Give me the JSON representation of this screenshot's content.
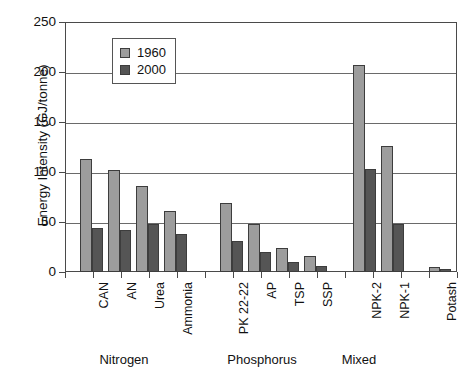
{
  "chart_data": {
    "type": "bar",
    "title": "",
    "xlabel": "",
    "ylabel": "Energy Intensity (GJ/tonne)",
    "ylim": [
      0,
      250
    ],
    "yticks": [
      0,
      50,
      100,
      150,
      200,
      250
    ],
    "grid": true,
    "legend_position": "upper-left-inside",
    "categories": [
      "CAN",
      "AN",
      "Urea",
      "Ammonia",
      "PK 22-22",
      "AP",
      "TSP",
      "SSP",
      "NPK-2",
      "NPK-1",
      "Potash"
    ],
    "series": [
      {
        "name": "1960",
        "color": "#9d9d9d",
        "values": [
          113,
          102,
          86,
          61,
          69,
          48,
          24,
          16,
          207,
          126,
          5
        ]
      },
      {
        "name": "2000",
        "color": "#555555",
        "values": [
          44,
          42,
          48,
          38,
          31,
          20,
          10,
          6,
          103,
          48,
          3
        ]
      }
    ],
    "groups": [
      {
        "label": "Nitrogen",
        "categories": [
          "CAN",
          "AN",
          "Urea",
          "Ammonia"
        ]
      },
      {
        "label": "Phosphorus",
        "categories": [
          "PK 22-22",
          "AP",
          "TSP",
          "SSP"
        ]
      },
      {
        "label": "Mixed",
        "categories": [
          "NPK-2",
          "NPK-1"
        ]
      },
      {
        "label": "",
        "categories": [
          "Potash"
        ]
      }
    ]
  },
  "axis": {
    "y_title": "Energy Intensity (GJ/tonne)",
    "y_tick_labels": [
      "250",
      "200",
      "150",
      "100",
      "50",
      "0"
    ]
  },
  "legend": {
    "entries": [
      {
        "label": "1960",
        "swatch": "legend-swatch-1960"
      },
      {
        "label": "2000",
        "swatch": "legend-swatch-2000"
      }
    ]
  },
  "group_labels": [
    "Nitrogen",
    "Phosphorus",
    "Mixed"
  ]
}
